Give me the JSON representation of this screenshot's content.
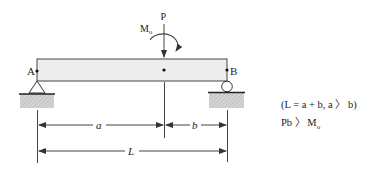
{
  "diagram": {
    "type": "simply-supported-beam",
    "beam_fill": "#ededed",
    "stroke": "#333333",
    "labels": {
      "point_a": "A",
      "point_b": "B",
      "load": "P",
      "moment_main": "M",
      "moment_sub": "o",
      "dim_a": "a",
      "dim_b": "b",
      "dim_L": "L"
    },
    "supports": {
      "left": "pin",
      "right": "roller"
    },
    "conditions": {
      "line1": "(L = a + b,  a 〉 b)",
      "line2": "Pb 〉 M",
      "line2_sub": "o"
    }
  }
}
